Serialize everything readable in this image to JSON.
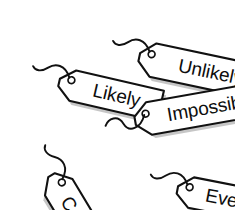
{
  "scene": {
    "title": "Probability word tags",
    "background_color": "#ffffff",
    "tag_fill": "#ffffff",
    "tag_outline": "#111111",
    "shadow_color": "#b9b9b9",
    "text_color": "#0d0d0d"
  },
  "tags": [
    {
      "id": "unlikely",
      "label": "Unlikely",
      "rotation_deg": 12,
      "x": 96,
      "y": 42,
      "width": 132,
      "height": 34,
      "font_size": 19,
      "icon": "luggage-tag-icon"
    },
    {
      "id": "likely",
      "label": "Likely",
      "rotation_deg": 13,
      "x": 16,
      "y": 66,
      "width": 104,
      "height": 31,
      "font_size": 19,
      "icon": "luggage-tag-icon"
    },
    {
      "id": "impossible",
      "label": "Impossible",
      "rotation_deg": -10,
      "x": 92,
      "y": 122,
      "width": 141,
      "height": 33,
      "font_size": 19,
      "icon": "luggage-tag-icon"
    },
    {
      "id": "certain",
      "label": "Certain",
      "rotation_deg": 59,
      "x": 28,
      "y": 131,
      "width": 100,
      "height": 32,
      "font_size": 19,
      "icon": "luggage-tag-icon"
    },
    {
      "id": "evens",
      "label": "Evens",
      "rotation_deg": 11,
      "x": 134,
      "y": 175,
      "width": 96,
      "height": 31,
      "font_size": 19,
      "icon": "luggage-tag-icon"
    }
  ]
}
